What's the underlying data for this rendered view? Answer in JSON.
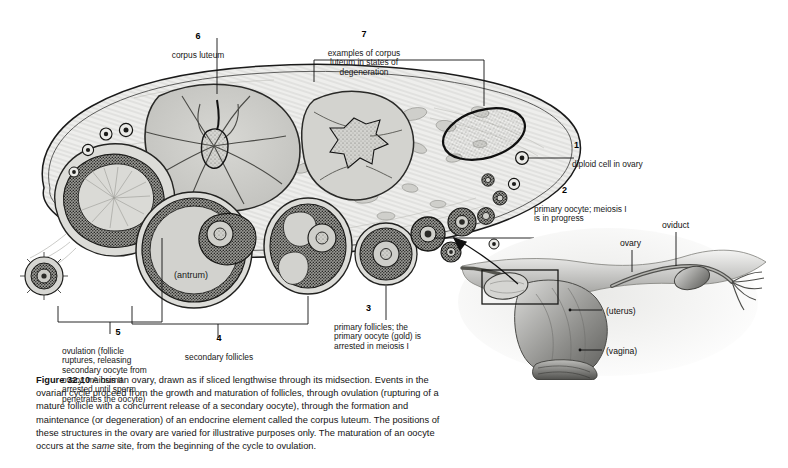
{
  "figure": {
    "number": "Figure 32.10",
    "caption_text": "  A human ovary, drawn as if sliced lengthwise through its midsection. Events in the ovarian cycle proceed from the growth and maturation of follicles, through ovulation (rupturing of a mature follicle with a concurrent release of a secondary oocyte), through the formation and maintenance (or degeneration) of an endocrine element called the corpus luteum. The positions of these structures in the ovary are varied for illustrative purposes only. The maturation of an oocyte occurs at the ",
    "caption_italic": "same",
    "caption_tail": " site, from the beginning of the cycle to ovulation."
  },
  "diagram": {
    "interior_label": "(antrum)",
    "callouts": [
      {
        "id": "1",
        "number": "1",
        "text": "diploid cell in ovary"
      },
      {
        "id": "2",
        "number": "2",
        "text": "primary oocyte; meiosis I\nis in progress"
      },
      {
        "id": "3",
        "number": "3",
        "text": "primary follicles; the\nprimary oocyte (gold) is\narrested in meiosis I"
      },
      {
        "id": "4",
        "number": "4",
        "text": "secondary follicles"
      },
      {
        "id": "5",
        "number": "5",
        "text": "ovulation (follicle\nruptures, releasing\nsecondary oocyte from\novary; meiosis II\narrested until sperm\npenetrates the oocyte)"
      },
      {
        "id": "6",
        "number": "6",
        "text": "corpus luteum"
      },
      {
        "id": "7",
        "number": "7",
        "text": "examples of corpus\nluteum in states of\ndegeneration"
      }
    ]
  },
  "inset": {
    "name": "female reproductive tract inset",
    "labels": [
      {
        "id": "oviduct",
        "text": "oviduct"
      },
      {
        "id": "ovary",
        "text": "ovary"
      },
      {
        "id": "uterus",
        "text": "(uterus)"
      },
      {
        "id": "vagina",
        "text": "(vagina)"
      }
    ]
  },
  "colors": {
    "ink": "#111111",
    "tissue_fill": "#d5d5d1",
    "stroma_fill": "#ececea",
    "corpus_luteum_fill": "#c9c9c5",
    "antrum_fill": "#d2d2ce",
    "granulosa_dark": "#4a4a48",
    "page_bg": "#ffffff"
  }
}
